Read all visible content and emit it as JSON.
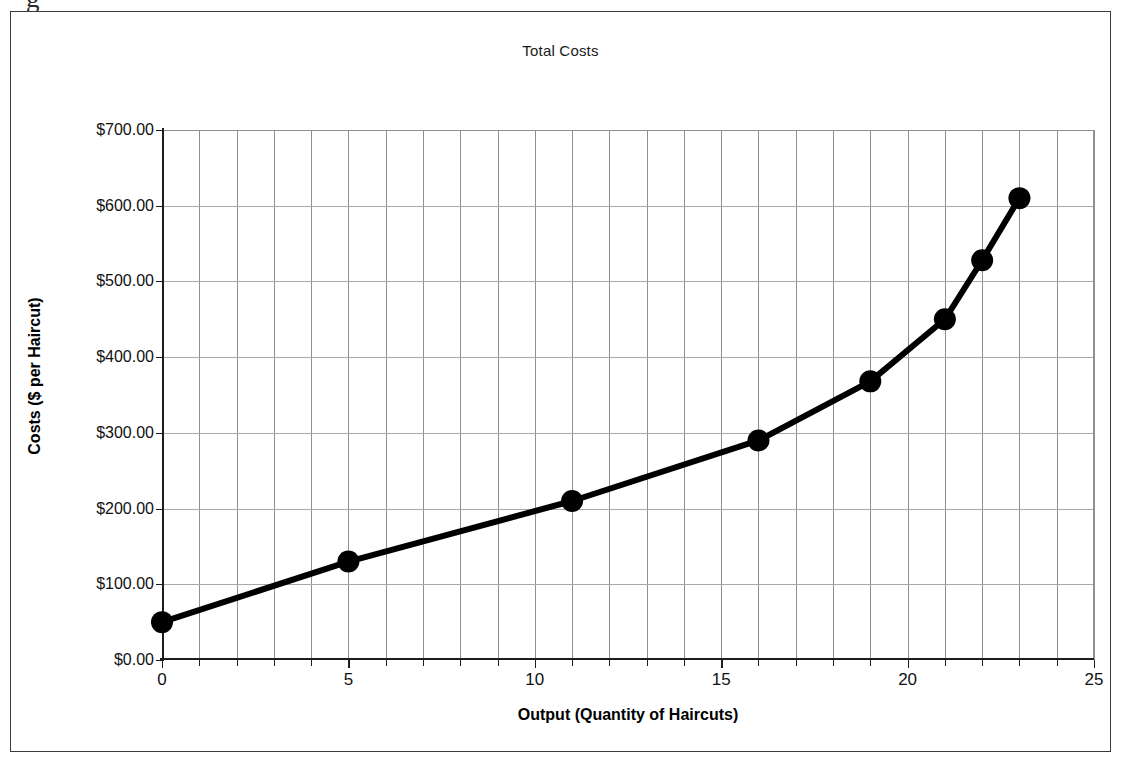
{
  "figure": {
    "top_cut_caption_fragment": "g",
    "frame_color": "#3a3a3a",
    "background": "#ffffff"
  },
  "chart_data": {
    "type": "line",
    "title": "Total Costs",
    "xlabel": "Output (Quantity of Haircuts)",
    "ylabel": "Costs ($ per Haircut)",
    "xlim": [
      0,
      25
    ],
    "ylim": [
      0,
      700
    ],
    "x_tick_labels": [
      "0",
      "5",
      "10",
      "15",
      "20",
      "25"
    ],
    "x_tick_values": [
      0,
      5,
      10,
      15,
      20,
      25
    ],
    "x_minor_tick_interval": 1,
    "y_tick_labels": [
      "$0.00",
      "$100.00",
      "$200.00",
      "$300.00",
      "$400.00",
      "$500.00",
      "$600.00",
      "$700.00"
    ],
    "y_tick_values": [
      0,
      100,
      200,
      300,
      400,
      500,
      600,
      700
    ],
    "grid": true,
    "grid_vertical_interval": 1,
    "grid_horizontal_interval": 100,
    "legend": false,
    "legend_position": "none",
    "series": [
      {
        "name": "Total Costs",
        "color": "#000000",
        "marker": "circle",
        "marker_size": 22,
        "line_width": 6,
        "x": [
          0,
          5,
          11,
          16,
          19,
          21,
          22,
          23
        ],
        "values": [
          50,
          130,
          210,
          290,
          368,
          450,
          528,
          610
        ],
        "points": [
          {
            "x": 0,
            "y": 50
          },
          {
            "x": 5,
            "y": 130
          },
          {
            "x": 11,
            "y": 210
          },
          {
            "x": 16,
            "y": 290
          },
          {
            "x": 19,
            "y": 368
          },
          {
            "x": 21,
            "y": 450
          },
          {
            "x": 22,
            "y": 528
          },
          {
            "x": 23,
            "y": 610
          }
        ]
      }
    ]
  }
}
